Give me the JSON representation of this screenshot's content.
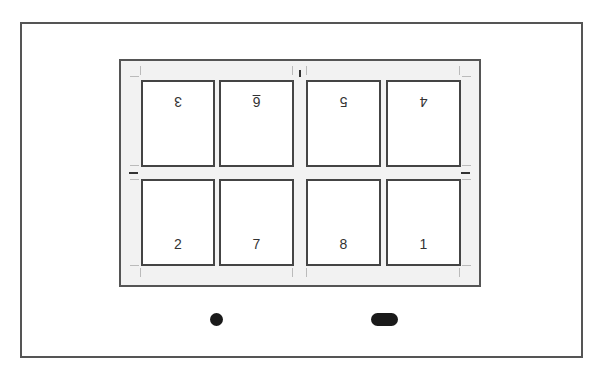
{
  "diagram": {
    "title": "",
    "layout": "2 rows x 4 columns imposition sheet",
    "top_row": [
      {
        "label": "3",
        "orientation": "rotated-180"
      },
      {
        "label": "6",
        "orientation": "rotated-180"
      },
      {
        "label": "5",
        "orientation": "rotated-180"
      },
      {
        "label": "4",
        "orientation": "rotated-180"
      }
    ],
    "bottom_row": [
      {
        "label": "2",
        "orientation": "upright"
      },
      {
        "label": "7",
        "orientation": "upright"
      },
      {
        "label": "8",
        "orientation": "upright"
      },
      {
        "label": "1",
        "orientation": "upright"
      }
    ],
    "controls": {
      "dot": "circle-indicator",
      "pill": "pill-indicator"
    },
    "colors": {
      "frame": "#555555",
      "sheet": "#f2f2f2",
      "card_border": "#444444",
      "indicator": "#1a1a1a"
    }
  }
}
